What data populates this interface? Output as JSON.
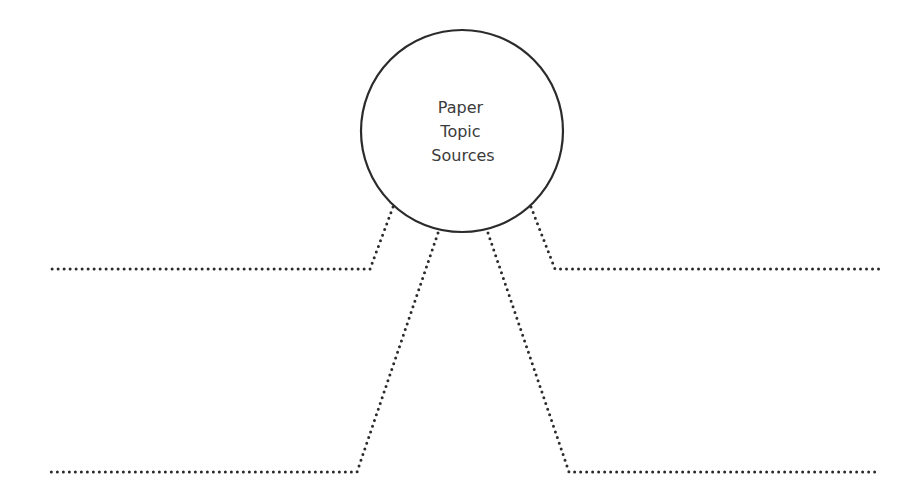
{
  "diagram": {
    "type": "outline-organizer",
    "center_node": {
      "lines": [
        "Paper",
        "Topic",
        "Sources"
      ],
      "cx": 462,
      "cy": 131,
      "r": 101
    },
    "branches": [
      {
        "name": "top-left-branch",
        "points": [
          [
            393,
            207
          ],
          [
            370,
            269
          ],
          [
            50,
            269
          ]
        ]
      },
      {
        "name": "top-right-branch",
        "points": [
          [
            531,
            207
          ],
          [
            555,
            269
          ],
          [
            879,
            269
          ]
        ]
      },
      {
        "name": "bottom-left-branch",
        "points": [
          [
            438,
            233
          ],
          [
            357,
            472
          ],
          [
            50,
            472
          ]
        ]
      },
      {
        "name": "bottom-right-branch",
        "points": [
          [
            488,
            233
          ],
          [
            569,
            472
          ],
          [
            879,
            472
          ]
        ]
      }
    ],
    "colors": {
      "stroke": "#2b2b2b",
      "text": "#3b3b3b",
      "background": "#ffffff"
    }
  }
}
